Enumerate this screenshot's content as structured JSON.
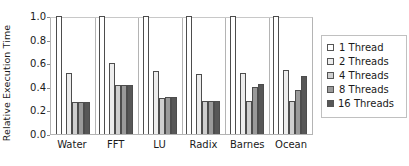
{
  "chart_data": {
    "type": "bar",
    "title": "",
    "subtitle": "",
    "xlabel": "",
    "ylabel": "Relative Execution Time",
    "ylim": [
      0.0,
      1.0
    ],
    "yticks": [
      "1.0",
      "0.8",
      "0.6",
      "0.4",
      "0.2",
      "0.0"
    ],
    "ytick_values": [
      1.0,
      0.8,
      0.6,
      0.4,
      0.2,
      0.0
    ],
    "grid": false,
    "legend_position": "right-outside",
    "categories": [
      "Water",
      "FFT",
      "LU",
      "Radix",
      "Barnes",
      "Ocean"
    ],
    "series": [
      {
        "name": "1 Thread",
        "color": "#ffffff",
        "values": [
          1.0,
          1.0,
          1.0,
          1.0,
          1.0,
          1.0
        ]
      },
      {
        "name": "2 Threads",
        "color": "#ededed",
        "values": [
          0.52,
          0.6,
          0.53,
          0.51,
          0.52,
          0.54
        ]
      },
      {
        "name": "4 Threads",
        "color": "#cfcfcf",
        "values": [
          0.275,
          0.415,
          0.305,
          0.28,
          0.28,
          0.28
        ]
      },
      {
        "name": "8 Threads",
        "color": "#9a9a9a",
        "values": [
          0.27,
          0.415,
          0.31,
          0.28,
          0.4,
          0.37
        ]
      },
      {
        "name": "16 Threads",
        "color": "#575757",
        "values": [
          0.27,
          0.415,
          0.315,
          0.28,
          0.42,
          0.49
        ]
      }
    ],
    "annotations": []
  },
  "legend": {
    "entries": [
      {
        "label": "1 Thread"
      },
      {
        "label": "2 Threads"
      },
      {
        "label": "4 Threads"
      },
      {
        "label": "8 Threads"
      },
      {
        "label": "16 Threads"
      }
    ]
  }
}
